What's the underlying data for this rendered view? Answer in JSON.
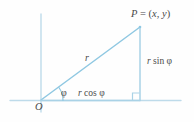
{
  "figure": {
    "background_color": "#fefefe",
    "line_color": "#8fc8e2",
    "axis_color": "#b9d9ea",
    "text_color": "#4a4a4a"
  },
  "labels": {
    "point_p": {
      "name": "P",
      "equals": " = (",
      "x": "x",
      "comma": ", ",
      "y": "y",
      "close": ")",
      "full_text": "P = (x, y)"
    },
    "hypotenuse": {
      "text": "r",
      "full_text": "r"
    },
    "opposite_leg": {
      "variable": "r",
      "function": " sin ",
      "angle": "φ",
      "full_text": "r sin φ"
    },
    "adjacent_leg": {
      "variable": "r",
      "function": " cos ",
      "angle": "φ",
      "full_text": "r cos φ"
    },
    "angle": {
      "text": "φ",
      "full_text": "φ"
    },
    "origin": {
      "text": "O",
      "full_text": "O"
    }
  },
  "geometry": {
    "origin": {
      "x": 41,
      "y": 100
    },
    "point_p": {
      "x": 140,
      "y": 27
    },
    "foot_of_perpendicular": {
      "x": 140,
      "y": 100
    },
    "vertical_axis": {
      "x": 41,
      "y_top": 14,
      "y_bottom": 112
    },
    "horizontal_axis": {
      "y": 100,
      "x_left": 10,
      "x_right": 181
    },
    "angle_arc_radius": 22,
    "angle_degrees": 36,
    "right_angle_marker_size": 7
  }
}
